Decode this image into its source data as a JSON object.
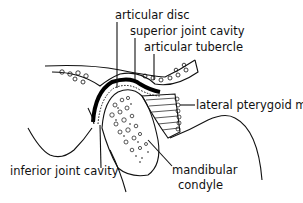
{
  "diagram": {
    "labels": {
      "articular_disc": "articular disc",
      "superior_joint_cavity": "superior joint cavity",
      "articular_tubercle": "articular tubercle",
      "lateral_pterygoid": "lateral pterygoid m.",
      "inferior_joint_cavity": "inferior joint cavity",
      "mandibular_condyle_1": "mandibular",
      "mandibular_condyle_2": "condyle"
    }
  }
}
